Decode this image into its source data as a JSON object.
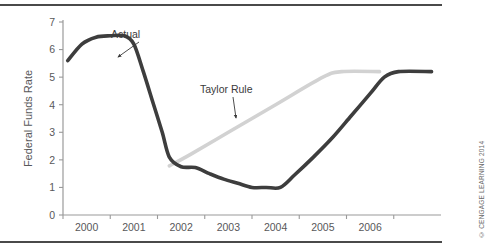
{
  "figure": {
    "credit": "© CENGAGE LEARNING 2014",
    "top_rule": "horizontal-rule",
    "bottom_rule": "horizontal-rule"
  },
  "chart_data": {
    "type": "line",
    "title": "",
    "xlabel": "",
    "ylabel": "Federal Funds Rate",
    "xlim": [
      1999.5,
      2007.5
    ],
    "ylim": [
      0,
      7
    ],
    "grid": false,
    "legend": "inline-annotations",
    "x_tick_labels": [
      "2000",
      "2001",
      "2002",
      "2003",
      "2004",
      "2005",
      "2006"
    ],
    "x_tick_values": [
      2000,
      2001,
      2002,
      2003,
      2004,
      2005,
      2006
    ],
    "y_tick_labels": [
      "0",
      "1",
      "2",
      "3",
      "4",
      "5",
      "6",
      "7"
    ],
    "y_tick_values": [
      0,
      1,
      2,
      3,
      4,
      5,
      6,
      7
    ],
    "series": [
      {
        "name": "Actual",
        "color": "#3d3d3d",
        "width": 3.6,
        "annotation": "Actual",
        "x": [
          1999.6,
          1999.9,
          2000.2,
          2000.5,
          2000.8,
          2001.0,
          2001.2,
          2001.4,
          2001.6,
          2001.75,
          2002.0,
          2002.3,
          2002.6,
          2002.9,
          2003.2,
          2003.5,
          2003.8,
          2004.1,
          2004.4,
          2004.8,
          2005.2,
          2005.6,
          2006.0,
          2006.3,
          2006.6,
          2007.3
        ],
        "y": [
          5.6,
          6.2,
          6.45,
          6.5,
          6.5,
          6.2,
          5.2,
          4.1,
          3.0,
          2.1,
          1.75,
          1.72,
          1.5,
          1.3,
          1.15,
          1.0,
          1.0,
          1.0,
          1.45,
          2.1,
          2.8,
          3.6,
          4.4,
          5.0,
          5.2,
          5.2
        ]
      },
      {
        "name": "Taylor Rule",
        "color": "#d2d2d2",
        "width": 3.6,
        "annotation": "Taylor Rule",
        "x": [
          2001.75,
          2002.2,
          2003.0,
          2004.0,
          2005.0,
          2005.4,
          2006.2
        ],
        "y": [
          1.78,
          2.2,
          3.0,
          4.0,
          5.0,
          5.2,
          5.2
        ]
      }
    ],
    "annotations": [
      {
        "text": "Actual",
        "label_x": 111,
        "label_y": 38,
        "arrow_from_x": 139,
        "arrow_from_y": 42,
        "arrow_to_x": 118,
        "arrow_to_y": 57
      },
      {
        "text": "Taylor Rule",
        "label_x": 200,
        "label_y": 93,
        "arrow_from_x": 233,
        "arrow_from_y": 97,
        "arrow_to_x": 236,
        "arrow_to_y": 118
      }
    ]
  }
}
